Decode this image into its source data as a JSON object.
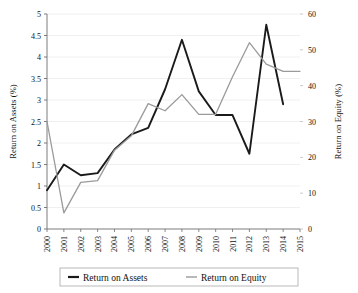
{
  "chart_data": {
    "type": "line",
    "title": "",
    "xlabel": "",
    "grid": "horizontal",
    "legend_position": "bottom",
    "categories": [
      "2000",
      "2001",
      "2002",
      "2003",
      "2004",
      "2005",
      "2006",
      "2007",
      "2008",
      "2009",
      "2010",
      "2011",
      "2012",
      "2013",
      "2014",
      "2015"
    ],
    "axes": {
      "left": {
        "label": "Return on Assets (%)",
        "ylim": [
          0,
          5
        ],
        "ticks": [
          "0",
          "0.5",
          "1",
          "1.5",
          "2",
          "2.5",
          "3",
          "3.5",
          "4",
          "4.5",
          "5"
        ],
        "tick_values": [
          0,
          0.5,
          1,
          1.5,
          2,
          2.5,
          3,
          3.5,
          4,
          4.5,
          5
        ]
      },
      "right": {
        "label": "Return on Equity (%)",
        "ylim": [
          0,
          60
        ],
        "ticks": [
          "0",
          "10",
          "20",
          "30",
          "40",
          "50",
          "60"
        ],
        "tick_values": [
          0,
          10,
          20,
          30,
          40,
          50,
          60
        ]
      }
    },
    "series": [
      {
        "name": "Return on Assets",
        "axis": "left",
        "color": "#1a1a1a",
        "width": 1.9,
        "x": [
          "2000",
          "2001",
          "2002",
          "2003",
          "2004",
          "2005",
          "2006",
          "2007",
          "2008",
          "2009",
          "2010",
          "2011",
          "2012",
          "2013",
          "2014"
        ],
        "values": [
          0.9,
          1.5,
          1.25,
          1.3,
          1.85,
          2.2,
          2.35,
          3.25,
          4.4,
          3.2,
          2.65,
          2.65,
          1.75,
          4.75,
          2.9
        ]
      },
      {
        "name": "Return on Equity",
        "axis": "right",
        "color": "#9a9a9a",
        "width": 1.3,
        "x": [
          "2000",
          "2001",
          "2002",
          "2003",
          "2004",
          "2005",
          "2006",
          "2007",
          "2008",
          "2009",
          "2010",
          "2011",
          "2012",
          "2013",
          "2014",
          "2015"
        ],
        "values": [
          30,
          4.5,
          13,
          13.5,
          22,
          26,
          35,
          33,
          37.5,
          32,
          32,
          42.5,
          52,
          46,
          44,
          44
        ]
      }
    ]
  },
  "legend": {
    "items": [
      {
        "label": "Return on Assets",
        "color": "#1a1a1a",
        "width": 2.2
      },
      {
        "label": "Return on Equity",
        "color": "#9a9a9a",
        "width": 1.4
      }
    ]
  }
}
